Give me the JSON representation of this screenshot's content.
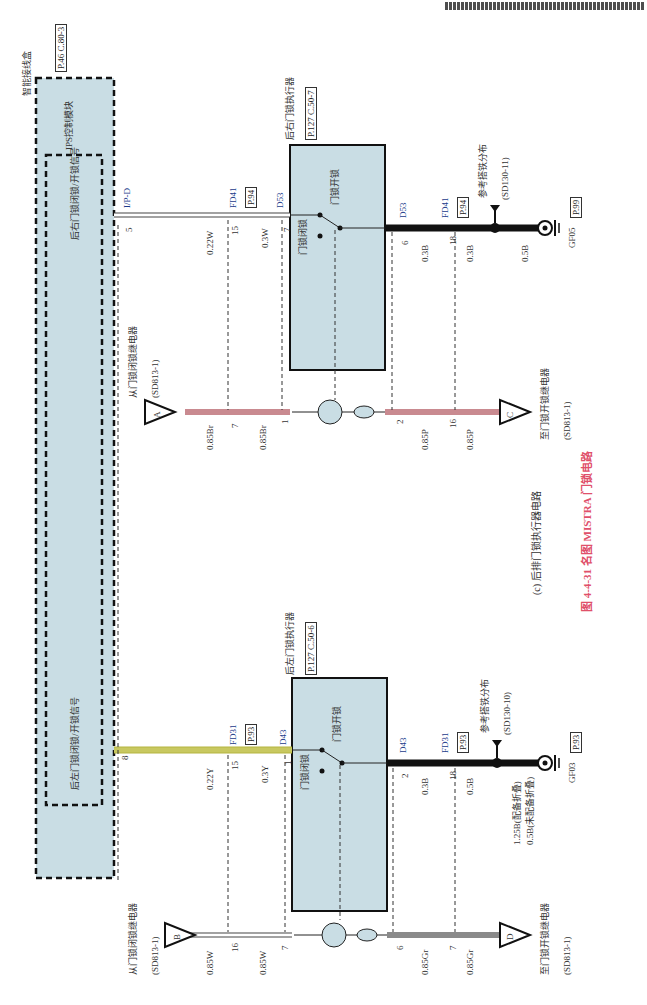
{
  "page_header": "中级汽车维修技术图册 电路",
  "module": {
    "name": "智能接线盒",
    "ref": [
      "P.46",
      "C.80-3"
    ],
    "inner_name": "IPS控制模块",
    "right_signal": "后右门锁闭锁/开锁信号",
    "left_signal": "后左门锁闭锁/开锁信号",
    "right_connector": "I/P-D",
    "right_pin": "5",
    "left_pin": "8"
  },
  "right_actuator": {
    "name": "后右门锁执行器",
    "ref": [
      "P.127",
      "C.50-7"
    ],
    "switch_open": "门锁开锁",
    "switch_close": "门锁闭锁",
    "connector_in": "D53",
    "connector_out": "D53",
    "pins": {
      "signal": "7",
      "motor_a": "1",
      "motor_b": "2",
      "ground": "6"
    },
    "signal_wires": [
      {
        "label": "0.22W",
        "pin": "15"
      },
      {
        "label": "0.3W"
      }
    ],
    "signal_connector": {
      "name": "FD41",
      "ref": "P.94"
    },
    "motor_left": {
      "relay_tag": "A",
      "relay_name": "从门锁闭锁继电器",
      "relay_ref": "(SD813-1)",
      "wires": [
        "0.85Br",
        "0.85Br"
      ],
      "inline_pin": "7"
    },
    "motor_right": {
      "relay_tag": "C",
      "relay_name": "至门锁开锁继电器",
      "relay_ref": "(SD813-1)",
      "wires": [
        "0.85P",
        "0.85P"
      ],
      "inline_pin": "16"
    },
    "ground": {
      "wires": [
        "0.3B",
        "0.3B",
        "0.5B"
      ],
      "inline_pin": "18",
      "connector": "FD41",
      "connector_ref": "P.94",
      "splice_ref": "参考搭铁分布",
      "splice_code": "(SD130-11)",
      "ground_id": "GF05",
      "ground_ref": "P.99"
    }
  },
  "left_actuator": {
    "name": "后左门锁执行器",
    "ref": [
      "P.127",
      "C.50-6"
    ],
    "switch_open": "门锁开锁",
    "switch_close": "门锁闭锁",
    "connector_in": "D43",
    "connector_out": "D43",
    "pins": {
      "signal": "1",
      "motor_a": "7",
      "motor_b": "6",
      "ground": "2"
    },
    "signal_wires": [
      {
        "label": "0.22Y",
        "pin": "15"
      },
      {
        "label": "0.3Y"
      }
    ],
    "signal_connector": {
      "name": "FD31",
      "ref": "P.93"
    },
    "motor_left": {
      "relay_tag": "B",
      "relay_name": "从门锁闭锁继电器",
      "relay_ref": "(SD813-1)",
      "wires": [
        "0.85W",
        "0.85W"
      ],
      "inline_pin": "16"
    },
    "motor_right": {
      "relay_tag": "D",
      "relay_name": "至门锁开锁继电器",
      "relay_ref": "(SD813-1)",
      "wires": [
        "0.85Gr",
        "0.85Gr"
      ],
      "inline_pin": "7"
    },
    "ground": {
      "wires": [
        "0.3B",
        "0.5B"
      ],
      "inline_pin": "18",
      "connector": "FD31",
      "connector_ref": "P.93",
      "splice_ref": "参考搭铁分布",
      "splice_code": "(SD130-10)",
      "ground_id": "GF03",
      "ground_ref": "P.93",
      "note1": "1.25B(配备折叠)",
      "note2": "0.5B(未配备折叠)"
    }
  },
  "caption": {
    "sub": "(c) 后排门锁执行器电路",
    "main": "图 4-4-31   名图 MISTRA 门锁电路"
  },
  "colors": {
    "module_fill": "#c9dde4",
    "pink_wire": "#c98a90",
    "yellow_wire": "#c8c860",
    "gray_wire": "#8a8a8a",
    "black_wire": "#111111",
    "caption_red": "#e0506a"
  }
}
